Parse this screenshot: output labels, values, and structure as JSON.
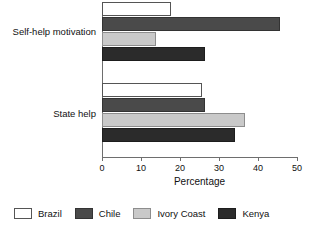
{
  "chart_data": {
    "type": "bar",
    "orientation": "horizontal",
    "title": "",
    "xlabel": "Percentage",
    "ylabel": "",
    "xlim": [
      0,
      50
    ],
    "xticks": [
      0,
      10,
      20,
      30,
      40,
      50
    ],
    "grid": false,
    "legend_position": "bottom",
    "categories": [
      "Self-help motivation",
      "State help"
    ],
    "series": [
      {
        "name": "Brazil",
        "color": "#ffffff",
        "values": [
          17.7,
          25.7
        ]
      },
      {
        "name": "Chile",
        "color": "#4a4a4a",
        "values": [
          45.6,
          26.5
        ]
      },
      {
        "name": "Ivory Coast",
        "color": "#c9c9c9",
        "values": [
          13.8,
          36.7
        ]
      },
      {
        "name": "Kenya",
        "color": "#2b2b2b",
        "values": [
          26.5,
          34.0
        ]
      }
    ]
  }
}
